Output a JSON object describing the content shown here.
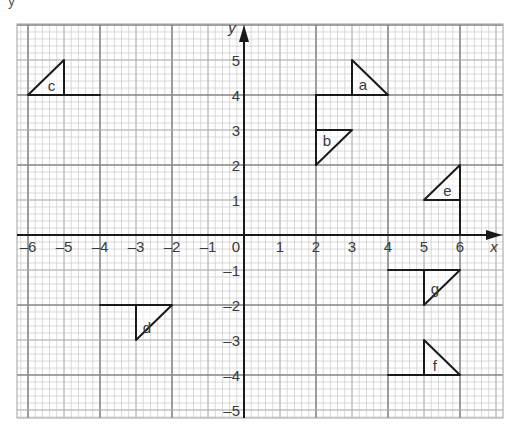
{
  "header": {
    "partial_text": "y"
  },
  "graph": {
    "x_axis": {
      "label": "x",
      "min": -6,
      "max": 6,
      "ticks": [
        "-6",
        "-5",
        "-4",
        "-3",
        "-2",
        "-1",
        "0",
        "1",
        "2",
        "3",
        "4",
        "5",
        "6"
      ]
    },
    "y_axis": {
      "label": "y",
      "min": -5,
      "max": 5,
      "ticks_pos": [
        "1",
        "2",
        "3",
        "4",
        "5"
      ],
      "ticks_neg": [
        "-1",
        "-2",
        "-3",
        "-4",
        "-5"
      ]
    },
    "grid": {
      "minor_per_unit": 5,
      "bold_every": 2
    },
    "colors": {
      "minor_grid": "#c8c8c8",
      "major_grid": "#8a8a8a",
      "axis": "#1a1a1a",
      "shape": "#1a1a1a",
      "text": "#3a3a3a"
    }
  },
  "shapes": [
    {
      "label": "a",
      "triangle": [
        [
          3,
          5
        ],
        [
          3,
          4
        ],
        [
          4,
          4
        ]
      ],
      "extra_lines": [
        [
          [
            2,
            2
          ],
          [
            2,
            4
          ]
        ],
        [
          [
            2,
            4
          ],
          [
            3,
            4
          ]
        ]
      ],
      "label_pos": [
        3.3,
        4.3
      ]
    },
    {
      "label": "b",
      "triangle": [
        [
          2,
          3
        ],
        [
          3,
          3
        ],
        [
          2,
          2
        ]
      ],
      "extra_lines": [],
      "label_pos": [
        2.3,
        2.7
      ]
    },
    {
      "label": "c",
      "triangle": [
        [
          -6,
          4
        ],
        [
          -5,
          5
        ],
        [
          -5,
          4
        ]
      ],
      "extra_lines": [
        [
          [
            -5,
            4
          ],
          [
            -4,
            4
          ]
        ]
      ],
      "label_pos": [
        -5.35,
        4.25
      ]
    },
    {
      "label": "d",
      "triangle": [
        [
          -3,
          -2
        ],
        [
          -2,
          -2
        ],
        [
          -3,
          -3
        ]
      ],
      "extra_lines": [
        [
          [
            -4,
            -2
          ],
          [
            -3,
            -2
          ]
        ]
      ],
      "label_pos": [
        -2.7,
        -2.65
      ]
    },
    {
      "label": "e",
      "triangle": [
        [
          5,
          1
        ],
        [
          6,
          2
        ],
        [
          6,
          1
        ]
      ],
      "extra_lines": [
        [
          [
            6,
            1
          ],
          [
            6,
            0
          ]
        ]
      ],
      "label_pos": [
        5.65,
        1.25
      ]
    },
    {
      "label": "f",
      "triangle": [
        [
          5,
          -3
        ],
        [
          5,
          -4
        ],
        [
          6,
          -4
        ]
      ],
      "extra_lines": [
        [
          [
            4,
            -4
          ],
          [
            5,
            -4
          ]
        ]
      ],
      "label_pos": [
        5.3,
        -3.75
      ]
    },
    {
      "label": "g",
      "triangle": [
        [
          5,
          -1
        ],
        [
          6,
          -1
        ],
        [
          5,
          -2
        ]
      ],
      "extra_lines": [
        [
          [
            4,
            -1
          ],
          [
            5,
            -1
          ]
        ]
      ],
      "label_pos": [
        5.3,
        -1.55
      ]
    }
  ],
  "chart_data": {
    "type": "scatter",
    "title": "",
    "xlabel": "x",
    "ylabel": "y",
    "xlim": [
      -6,
      6
    ],
    "ylim": [
      -5,
      5
    ],
    "grid": true,
    "series": [
      {
        "name": "a",
        "points": [
          [
            3,
            5
          ],
          [
            3,
            4
          ],
          [
            4,
            4
          ]
        ]
      },
      {
        "name": "b",
        "points": [
          [
            2,
            3
          ],
          [
            3,
            3
          ],
          [
            2,
            2
          ]
        ]
      },
      {
        "name": "c",
        "points": [
          [
            -6,
            4
          ],
          [
            -5,
            5
          ],
          [
            -5,
            4
          ]
        ]
      },
      {
        "name": "d",
        "points": [
          [
            -3,
            -2
          ],
          [
            -2,
            -2
          ],
          [
            -3,
            -3
          ]
        ]
      },
      {
        "name": "e",
        "points": [
          [
            5,
            1
          ],
          [
            6,
            2
          ],
          [
            6,
            1
          ]
        ]
      },
      {
        "name": "f",
        "points": [
          [
            5,
            -3
          ],
          [
            5,
            -4
          ],
          [
            6,
            -4
          ]
        ]
      },
      {
        "name": "g",
        "points": [
          [
            5,
            -1
          ],
          [
            6,
            -1
          ],
          [
            5,
            -2
          ]
        ]
      }
    ]
  }
}
